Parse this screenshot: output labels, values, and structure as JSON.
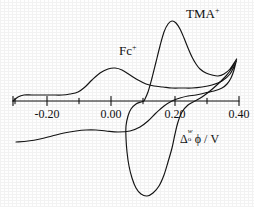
{
  "figure": {
    "kind": "cyclic-voltammogram",
    "background_color": "#ffffff",
    "ink_color": "#101010"
  },
  "axis": {
    "title": {
      "delta": "Δ",
      "superscript": "w",
      "subscript": "o",
      "phi": "ϕ",
      "separator": " / ",
      "unit": "V",
      "full_text": "Δₒʷϕ / V"
    },
    "tick_labels": [
      "-0.20",
      "0.00",
      "0.20",
      "0.40"
    ],
    "tick_values": [
      -0.2,
      0.0,
      0.2,
      0.4
    ],
    "minor_ticks_between": 1,
    "baseline_y_px": 101
  },
  "annotations": [
    {
      "name": "tma-peak-label",
      "base": "TMA",
      "charge": "+",
      "x_px": 190,
      "y_px": 8
    },
    {
      "name": "fc-peak-label",
      "base": "Fc",
      "charge": "+",
      "x_px": 122,
      "y_px": 45
    }
  ],
  "chart_data": {
    "type": "line",
    "title": "",
    "xlabel": "Δₒʷϕ / V",
    "ylabel": "Current (arb. units)",
    "xlim": [
      -0.32,
      0.4
    ],
    "ylim": [
      -1.0,
      1.0
    ],
    "grid": false,
    "legend": "none",
    "xticks": [
      -0.2,
      0.0,
      0.2,
      0.4
    ],
    "xticklabels": [
      "-0.20",
      "0.00",
      "0.20",
      "0.40"
    ],
    "annotations": [
      {
        "text": "TMA+",
        "x": 0.25,
        "y": 0.92
      },
      {
        "text": "Fc+",
        "x": 0.03,
        "y": 0.46
      }
    ],
    "series": [
      {
        "name": "Fc+ transfer wave",
        "forward_peak": {
          "x": 0.02,
          "y": 0.33
        },
        "reverse_peak": {
          "x": -0.05,
          "y": -0.3
        },
        "points_px": [
          [
            13,
            101
          ],
          [
            18,
            97
          ],
          [
            24,
            95
          ],
          [
            32,
            95
          ],
          [
            42,
            95
          ],
          [
            52,
            95
          ],
          [
            62,
            95
          ],
          [
            70,
            94
          ],
          [
            78,
            92
          ],
          [
            85,
            87
          ],
          [
            92,
            80
          ],
          [
            100,
            73
          ],
          [
            108,
            69
          ],
          [
            115,
            68
          ],
          [
            122,
            70
          ],
          [
            130,
            75
          ],
          [
            138,
            80
          ],
          [
            146,
            84
          ],
          [
            154,
            86
          ],
          [
            163,
            87
          ],
          [
            172,
            88
          ],
          [
            182,
            88
          ],
          [
            192,
            88
          ],
          [
            202,
            87
          ],
          [
            212,
            85
          ],
          [
            222,
            81
          ],
          [
            230,
            74
          ],
          [
            236,
            62
          ],
          [
            236,
            62
          ],
          [
            234,
            70
          ],
          [
            231,
            78
          ],
          [
            227,
            84
          ],
          [
            222,
            88
          ],
          [
            214,
            91
          ],
          [
            205,
            93
          ],
          [
            196,
            95
          ],
          [
            188,
            96
          ],
          [
            180,
            98
          ],
          [
            172,
            101
          ],
          [
            164,
            106
          ],
          [
            156,
            113
          ],
          [
            148,
            121
          ],
          [
            140,
            127
          ],
          [
            130,
            131
          ],
          [
            118,
            132
          ],
          [
            106,
            131
          ],
          [
            96,
            130
          ],
          [
            86,
            130
          ],
          [
            76,
            131
          ],
          [
            64,
            133
          ],
          [
            52,
            136
          ],
          [
            40,
            139
          ],
          [
            28,
            141
          ],
          [
            16,
            142
          ]
        ]
      },
      {
        "name": "TMA+ transfer wave",
        "forward_peak": {
          "x": 0.185,
          "y": 0.86
        },
        "reverse_peak": {
          "x": 0.12,
          "y": -0.92
        },
        "points_px": [
          [
            144,
            101
          ],
          [
            148,
            92
          ],
          [
            152,
            78
          ],
          [
            156,
            62
          ],
          [
            160,
            46
          ],
          [
            164,
            32
          ],
          [
            168,
            24
          ],
          [
            172,
            21
          ],
          [
            176,
            23
          ],
          [
            180,
            29
          ],
          [
            184,
            38
          ],
          [
            188,
            48
          ],
          [
            192,
            57
          ],
          [
            196,
            64
          ],
          [
            200,
            69
          ],
          [
            206,
            73
          ],
          [
            212,
            75
          ],
          [
            218,
            76
          ],
          [
            224,
            74
          ],
          [
            230,
            69
          ],
          [
            236,
            60
          ],
          [
            236,
            60
          ],
          [
            232,
            68
          ],
          [
            226,
            76
          ],
          [
            218,
            84
          ],
          [
            210,
            91
          ],
          [
            202,
            97
          ],
          [
            195,
            101
          ],
          [
            188,
            105
          ],
          [
            182,
            112
          ],
          [
            178,
            122
          ],
          [
            175,
            134
          ],
          [
            172,
            148
          ],
          [
            168,
            162
          ],
          [
            164,
            175
          ],
          [
            159,
            186
          ],
          [
            153,
            193
          ],
          [
            147,
            196
          ],
          [
            141,
            194
          ],
          [
            136,
            188
          ],
          [
            132,
            178
          ],
          [
            129,
            166
          ],
          [
            127,
            152
          ],
          [
            126,
            138
          ],
          [
            126,
            126
          ],
          [
            128,
            116
          ],
          [
            131,
            109
          ],
          [
            136,
            104
          ],
          [
            141,
            102
          ],
          [
            144,
            101
          ]
        ]
      }
    ]
  }
}
